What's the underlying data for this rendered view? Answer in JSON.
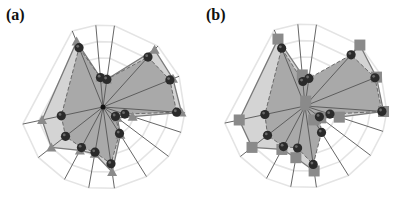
{
  "chart_data": [
    {
      "type": "radar",
      "panel_label": "(a)",
      "axes_count": 14,
      "rings": [
        1,
        2,
        3,
        4,
        5
      ],
      "rmax": 5,
      "center": [
        103,
        107
      ],
      "radius": 82,
      "angles_deg": [
        -112,
        -95,
        -82,
        -48,
        -22,
        4,
        18,
        37,
        58,
        82,
        100,
        118,
        142,
        168
      ],
      "series": [
        {
          "name": "reference",
          "marker": "triangle",
          "line": "solid",
          "fill": "#d2d2d2",
          "values": [
            4.3,
            1.8,
            1.7,
            4.7,
            4.6,
            4.8,
            1.9,
            1.1,
            2.0,
            4.0,
            2.9,
            3.0,
            4.0,
            3.8
          ]
        },
        {
          "name": "model",
          "marker": "circle",
          "line": "dashed",
          "fill": "#a8a8a8",
          "values": [
            3.9,
            1.8,
            1.7,
            4.1,
            4.4,
            4.5,
            1.4,
            0.95,
            1.9,
            3.5,
            2.8,
            2.8,
            2.9,
            2.6
          ]
        }
      ]
    },
    {
      "type": "radar",
      "panel_label": "(b)",
      "axes_count": 14,
      "rings": [
        1,
        2,
        3,
        4,
        5
      ],
      "rmax": 5,
      "center": [
        305,
        106
      ],
      "radius": 82,
      "angles_deg": [
        -112,
        -95,
        -82,
        -48,
        -22,
        4,
        18,
        37,
        58,
        82,
        100,
        118,
        142,
        168
      ],
      "series": [
        {
          "name": "reference",
          "marker": "square",
          "line": "solid",
          "fill": "#d2d2d2",
          "values": [
            4.4,
            1.9,
            0.3,
            5.0,
            4.7,
            4.8,
            2.2,
            1.2,
            1.0,
            4.0,
            3.2,
            3.0,
            4.1,
            4.1
          ]
        },
        {
          "name": "model",
          "marker": "circle",
          "line": "dashed",
          "fill": "#a8a8a8",
          "values": [
            3.8,
            1.5,
            1.7,
            4.2,
            4.6,
            4.7,
            1.6,
            1.1,
            1.9,
            3.6,
            2.6,
            2.8,
            2.9,
            2.5
          ]
        }
      ]
    }
  ],
  "panels": {
    "a": {
      "label": "(a)"
    },
    "b": {
      "label": "(b)"
    }
  },
  "colors": {
    "ring": "#e4e4e4",
    "spoke": "#555555",
    "outer_fill": "#d4d4d4",
    "inner_fill": "#a9a9a9",
    "outer_line": "#7a7a7a",
    "inner_line": "#6a6a6a",
    "triangle": "#8a8a8a",
    "square": "#8a8a8a",
    "circle": "#2a2a2a"
  }
}
